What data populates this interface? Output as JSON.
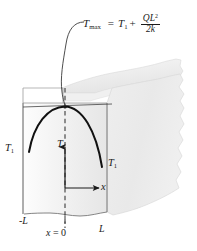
{
  "figure": {
    "background_color": "#ffffff",
    "line_color": "#1a1a1a",
    "slab_front_fill": "#efefef",
    "slab_side_fill": "#e8e8e8",
    "slab_top_fill": "#f2f2f2",
    "curve_color": "#111111"
  },
  "formula": {
    "lhs": "T",
    "lhs_sub": "max",
    "equals": "=",
    "term1": "T",
    "term1_sub": "1",
    "plus": "+",
    "numerator": "QL",
    "numerator_sup": "2",
    "denominator": "2k",
    "full_text": "Tmax = T1 + QL^2 / 2k"
  },
  "labels": {
    "t1_left": "T",
    "t1_left_sub": "1",
    "t1_right": "T",
    "t1_right_sub": "1",
    "t_axis": "T",
    "x_axis": "x",
    "neg_L": "-L",
    "x_zero_var": "x",
    "x_zero_eq": "= 0",
    "x_zero_full": "x = 0",
    "pos_L": "L"
  },
  "geometry": {
    "front_face_left_x": 23,
    "front_face_right_x": 107,
    "front_face_top_y": 103,
    "front_face_bottom_y": 214,
    "parabola_peak_x": 65,
    "parabola_peak_y": 107,
    "parabola_end_left_y": 152,
    "parabola_end_right_y": 167,
    "origin_x": 65,
    "origin_y": 188,
    "t_arrow_tip_y": 145,
    "x_arrow_tip_x": 100
  }
}
